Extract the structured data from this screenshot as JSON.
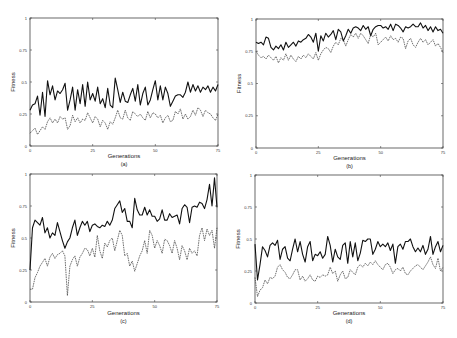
{
  "figure": {
    "panels_layout": "2x2"
  },
  "chart_data": [
    {
      "type": "line",
      "panel": "(a)",
      "xlabel": "Generations",
      "ylabel": "Fitness",
      "xlim": [
        0,
        75
      ],
      "ylim": [
        0,
        1
      ],
      "xticks": [
        "0",
        "25",
        "50",
        "75"
      ],
      "yticks": [
        "0",
        "0.25",
        "0.5",
        "0.75",
        "1"
      ],
      "series": [
        {
          "name": "best",
          "style": "solid",
          "values": [
            0.28,
            0.32,
            0.33,
            0.39,
            0.24,
            0.42,
            0.23,
            0.51,
            0.4,
            0.47,
            0.36,
            0.43,
            0.41,
            0.44,
            0.49,
            0.28,
            0.36,
            0.46,
            0.28,
            0.44,
            0.33,
            0.48,
            0.31,
            0.5,
            0.36,
            0.41,
            0.35,
            0.46,
            0.33,
            0.37,
            0.3,
            0.45,
            0.32,
            0.3,
            0.53,
            0.44,
            0.34,
            0.42,
            0.35,
            0.34,
            0.4,
            0.45,
            0.35,
            0.48,
            0.32,
            0.41,
            0.46,
            0.32,
            0.36,
            0.44,
            0.51,
            0.36,
            0.47,
            0.36,
            0.46,
            0.41,
            0.31,
            0.35,
            0.39,
            0.4,
            0.4,
            0.38,
            0.42,
            0.5,
            0.42,
            0.48,
            0.43,
            0.47,
            0.42,
            0.46,
            0.44,
            0.47,
            0.42,
            0.46,
            0.43,
            0.48
          ]
        },
        {
          "name": "average",
          "style": "dashed",
          "values": [
            0.1,
            0.12,
            0.14,
            0.09,
            0.12,
            0.15,
            0.13,
            0.19,
            0.22,
            0.18,
            0.21,
            0.18,
            0.23,
            0.21,
            0.22,
            0.13,
            0.16,
            0.24,
            0.19,
            0.22,
            0.18,
            0.21,
            0.2,
            0.26,
            0.22,
            0.18,
            0.23,
            0.21,
            0.15,
            0.2,
            0.18,
            0.13,
            0.19,
            0.17,
            0.22,
            0.28,
            0.22,
            0.21,
            0.28,
            0.22,
            0.2,
            0.27,
            0.25,
            0.23,
            0.25,
            0.22,
            0.2,
            0.27,
            0.22,
            0.26,
            0.25,
            0.22,
            0.24,
            0.18,
            0.22,
            0.24,
            0.19,
            0.2,
            0.27,
            0.25,
            0.29,
            0.21,
            0.25,
            0.21,
            0.23,
            0.28,
            0.24,
            0.3,
            0.28,
            0.23,
            0.28,
            0.26,
            0.25,
            0.22,
            0.2,
            0.25
          ]
        }
      ]
    },
    {
      "type": "line",
      "panel": "(b)",
      "xlabel": "Generations",
      "ylabel": "Fitness",
      "xlim": [
        0,
        75
      ],
      "ylim": [
        0,
        1
      ],
      "xticks": [
        "0",
        "25",
        "50",
        "75"
      ],
      "yticks": [
        "0",
        "0.25",
        "0.5",
        "0.75",
        "1"
      ],
      "series": [
        {
          "name": "best",
          "style": "solid",
          "values": [
            0.82,
            0.81,
            0.82,
            0.8,
            0.86,
            0.85,
            0.78,
            0.76,
            0.79,
            0.77,
            0.8,
            0.76,
            0.82,
            0.78,
            0.8,
            0.82,
            0.79,
            0.83,
            0.82,
            0.84,
            0.85,
            0.88,
            0.86,
            0.82,
            0.89,
            0.75,
            0.87,
            0.83,
            0.89,
            0.86,
            0.88,
            0.91,
            0.84,
            0.92,
            0.9,
            0.83,
            0.87,
            0.92,
            0.89,
            0.93,
            0.94,
            0.93,
            0.91,
            0.95,
            0.92,
            0.94,
            0.87,
            0.92,
            0.94,
            0.95,
            0.95,
            0.93,
            0.94,
            0.92,
            0.96,
            0.91,
            0.96,
            0.95,
            0.93,
            0.9,
            0.94,
            0.93,
            0.94,
            0.96,
            0.94,
            0.94,
            0.97,
            0.93,
            0.95,
            0.91,
            0.94,
            0.9,
            0.94,
            0.91,
            0.92,
            0.89
          ]
        },
        {
          "name": "average",
          "style": "dashed",
          "values": [
            0.75,
            0.72,
            0.7,
            0.71,
            0.69,
            0.72,
            0.7,
            0.68,
            0.71,
            0.66,
            0.7,
            0.68,
            0.73,
            0.68,
            0.72,
            0.69,
            0.67,
            0.71,
            0.69,
            0.72,
            0.7,
            0.73,
            0.71,
            0.69,
            0.74,
            0.68,
            0.73,
            0.76,
            0.78,
            0.77,
            0.74,
            0.79,
            0.82,
            0.8,
            0.85,
            0.84,
            0.79,
            0.84,
            0.88,
            0.86,
            0.89,
            0.85,
            0.89,
            0.87,
            0.84,
            0.81,
            0.88,
            0.86,
            0.89,
            0.8,
            0.82,
            0.84,
            0.86,
            0.83,
            0.87,
            0.84,
            0.85,
            0.82,
            0.86,
            0.85,
            0.77,
            0.83,
            0.85,
            0.8,
            0.78,
            0.82,
            0.85,
            0.82,
            0.84,
            0.8,
            0.82,
            0.84,
            0.79,
            0.81,
            0.78,
            0.74
          ]
        }
      ]
    },
    {
      "type": "line",
      "panel": "(c)",
      "xlabel": "Generations",
      "ylabel": "Fitness",
      "xlim": [
        0,
        75
      ],
      "ylim": [
        0,
        1
      ],
      "xticks": [
        "0",
        "25",
        "50",
        "75"
      ],
      "yticks": [
        "0",
        "0.25",
        "0.5",
        "0.75",
        "1"
      ],
      "series": [
        {
          "name": "best",
          "style": "solid",
          "values": [
            0.25,
            0.58,
            0.64,
            0.62,
            0.6,
            0.66,
            0.54,
            0.58,
            0.5,
            0.54,
            0.52,
            0.62,
            0.55,
            0.48,
            0.42,
            0.47,
            0.5,
            0.58,
            0.64,
            0.52,
            0.58,
            0.63,
            0.6,
            0.63,
            0.55,
            0.6,
            0.61,
            0.59,
            0.58,
            0.6,
            0.59,
            0.63,
            0.6,
            0.64,
            0.73,
            0.76,
            0.79,
            0.7,
            0.73,
            0.63,
            0.63,
            0.58,
            0.81,
            0.72,
            0.68,
            0.68,
            0.74,
            0.68,
            0.72,
            0.67,
            0.67,
            0.63,
            0.65,
            0.72,
            0.64,
            0.64,
            0.69,
            0.66,
            0.67,
            0.68,
            0.61,
            0.73,
            0.76,
            0.74,
            0.62,
            0.74,
            0.75,
            0.74,
            0.78,
            0.77,
            0.73,
            0.8,
            0.92,
            0.75,
            0.97,
            0.74
          ]
        },
        {
          "name": "average",
          "style": "dashed",
          "values": [
            0.1,
            0.1,
            0.19,
            0.23,
            0.28,
            0.31,
            0.34,
            0.28,
            0.35,
            0.38,
            0.34,
            0.37,
            0.38,
            0.4,
            0.36,
            0.05,
            0.28,
            0.33,
            0.36,
            0.28,
            0.35,
            0.38,
            0.42,
            0.41,
            0.36,
            0.42,
            0.35,
            0.52,
            0.4,
            0.34,
            0.46,
            0.43,
            0.48,
            0.5,
            0.4,
            0.48,
            0.56,
            0.52,
            0.36,
            0.38,
            0.28,
            0.32,
            0.24,
            0.3,
            0.36,
            0.4,
            0.48,
            0.38,
            0.56,
            0.52,
            0.42,
            0.48,
            0.44,
            0.38,
            0.49,
            0.48,
            0.44,
            0.38,
            0.48,
            0.42,
            0.33,
            0.44,
            0.4,
            0.33,
            0.42,
            0.38,
            0.4,
            0.36,
            0.52,
            0.58,
            0.48,
            0.57,
            0.52,
            0.56,
            0.42,
            0.58
          ]
        }
      ]
    },
    {
      "type": "line",
      "panel": "(d)",
      "xlabel": "Generations",
      "ylabel": "Fitness",
      "xlim": [
        0,
        75
      ],
      "ylim": [
        0,
        1
      ],
      "xticks": [
        "0",
        "25",
        "50",
        "75"
      ],
      "yticks": [
        "0",
        "0.25",
        "0.5",
        "0.75",
        "1"
      ],
      "series": [
        {
          "name": "best",
          "style": "solid",
          "values": [
            0.46,
            0.18,
            0.3,
            0.44,
            0.41,
            0.36,
            0.45,
            0.47,
            0.45,
            0.49,
            0.34,
            0.42,
            0.44,
            0.35,
            0.33,
            0.42,
            0.5,
            0.4,
            0.48,
            0.38,
            0.32,
            0.44,
            0.48,
            0.33,
            0.38,
            0.37,
            0.4,
            0.35,
            0.38,
            0.52,
            0.45,
            0.32,
            0.42,
            0.36,
            0.34,
            0.45,
            0.47,
            0.31,
            0.48,
            0.36,
            0.47,
            0.33,
            0.39,
            0.49,
            0.48,
            0.5,
            0.5,
            0.38,
            0.42,
            0.48,
            0.44,
            0.46,
            0.44,
            0.47,
            0.41,
            0.46,
            0.31,
            0.44,
            0.46,
            0.42,
            0.48,
            0.48,
            0.5,
            0.44,
            0.4,
            0.43,
            0.4,
            0.45,
            0.38,
            0.42,
            0.52,
            0.38,
            0.44,
            0.48,
            0.4,
            0.45
          ]
        },
        {
          "name": "average",
          "style": "dashed",
          "values": [
            0.2,
            0.05,
            0.1,
            0.12,
            0.18,
            0.15,
            0.2,
            0.19,
            0.21,
            0.28,
            0.3,
            0.26,
            0.24,
            0.2,
            0.19,
            0.22,
            0.26,
            0.26,
            0.18,
            0.21,
            0.17,
            0.19,
            0.22,
            0.18,
            0.17,
            0.21,
            0.2,
            0.22,
            0.21,
            0.22,
            0.28,
            0.23,
            0.25,
            0.17,
            0.22,
            0.25,
            0.19,
            0.2,
            0.26,
            0.24,
            0.22,
            0.28,
            0.3,
            0.28,
            0.31,
            0.29,
            0.32,
            0.3,
            0.33,
            0.3,
            0.28,
            0.26,
            0.3,
            0.31,
            0.28,
            0.23,
            0.26,
            0.27,
            0.25,
            0.28,
            0.23,
            0.22,
            0.25,
            0.27,
            0.29,
            0.3,
            0.28,
            0.26,
            0.29,
            0.32,
            0.36,
            0.3,
            0.27,
            0.35,
            0.25,
            0.28
          ]
        }
      ]
    }
  ]
}
